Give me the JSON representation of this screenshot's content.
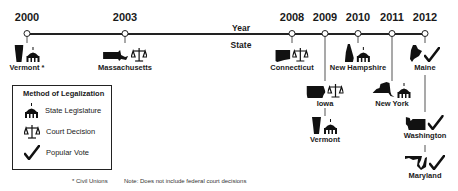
{
  "timeline": {
    "axis_labels": {
      "year": "Year",
      "state": "State"
    },
    "years": [
      {
        "label": "2000",
        "x": 27
      },
      {
        "label": "2003",
        "x": 125
      },
      {
        "label": "2008",
        "x": 292
      },
      {
        "label": "2009",
        "x": 325
      },
      {
        "label": "2010",
        "x": 358
      },
      {
        "label": "2011",
        "x": 392
      },
      {
        "label": "2012",
        "x": 425
      }
    ],
    "events": [
      {
        "year": "2000",
        "state": "Vermont *",
        "method": "State Legislature"
      },
      {
        "year": "2003",
        "state": "Massachusetts",
        "method": "Court Decision"
      },
      {
        "year": "2008",
        "state": "Connecticut",
        "method": "Court Decision"
      },
      {
        "year": "2009",
        "state": "Iowa",
        "method": "Court Decision"
      },
      {
        "year": "2009",
        "state": "Vermont",
        "method": "State Legislature"
      },
      {
        "year": "2010",
        "state": "New Hampshire",
        "method": "State Legislature"
      },
      {
        "year": "2011",
        "state": "New York",
        "method": "State Legislature"
      },
      {
        "year": "2012",
        "state": "Maine",
        "method": "Popular Vote"
      },
      {
        "year": "2012",
        "state": "Washington",
        "method": "Popular Vote"
      },
      {
        "year": "2012",
        "state": "Maryland",
        "method": "Popular Vote"
      }
    ]
  },
  "legend": {
    "title": "Method of Legalization",
    "items": [
      {
        "icon": "capitol-icon",
        "label": "State Legislature"
      },
      {
        "icon": "scales-icon",
        "label": "Court Decision"
      },
      {
        "icon": "checkmark-icon",
        "label": "Popular Vote"
      }
    ]
  },
  "footnotes": {
    "civil_unions": "* Civil Unions",
    "note": "Note: Does not include federal court decisions"
  },
  "colors": {
    "ink": "#111111",
    "background": "#ffffff"
  }
}
